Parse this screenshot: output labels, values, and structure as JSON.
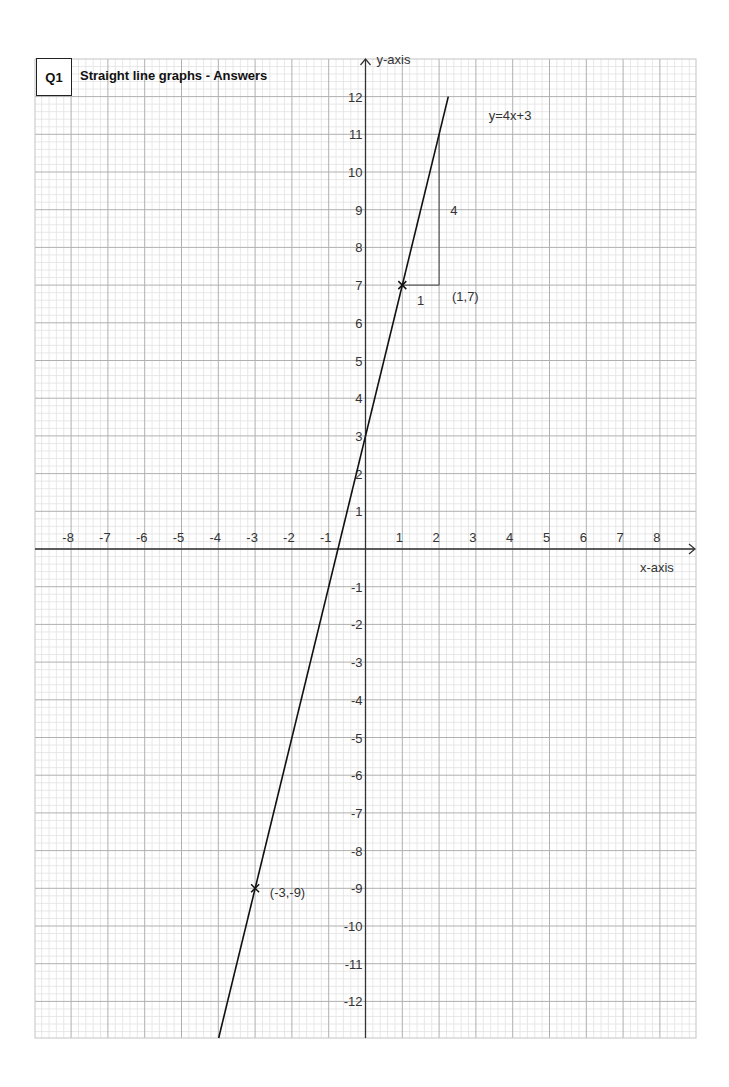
{
  "header": {
    "question_number": "Q1",
    "title": "Straight line graphs - Answers"
  },
  "chart_data": {
    "type": "line",
    "title": "Straight line graphs - Answers",
    "xlabel": "x-axis",
    "ylabel": "y-axis",
    "xlim": [
      -8,
      8
    ],
    "ylim": [
      -12,
      12
    ],
    "grid": true,
    "x_tick_labels": [
      "-8",
      "-7",
      "-6",
      "-5",
      "-4",
      "-3",
      "-2",
      "-1",
      "1",
      "2",
      "3",
      "4",
      "5",
      "6",
      "7",
      "8"
    ],
    "y_tick_labels": [
      "12",
      "11",
      "10",
      "9",
      "8",
      "7",
      "6",
      "5",
      "4",
      "3",
      "2",
      "1",
      "-1",
      "-2",
      "-3",
      "-4",
      "-5",
      "-6",
      "-7",
      "-8",
      "-9",
      "-10",
      "-11",
      "-12"
    ],
    "series": [
      {
        "name": "y=4x+3",
        "equation": "y=4x+3",
        "slope": 4,
        "intercept": 3,
        "x": [
          -3.99,
          2.25
        ],
        "y": [
          -12.97,
          12
        ]
      }
    ],
    "points": [
      {
        "x": 1,
        "y": 7,
        "label": "(1,7)",
        "marker": "x"
      },
      {
        "x": -3,
        "y": -9,
        "label": "(-3,-9)",
        "marker": "x"
      }
    ],
    "slope_triangle": {
      "from": [
        1,
        7
      ],
      "corner": [
        2,
        7
      ],
      "to": [
        2,
        11
      ],
      "run_label": "1",
      "rise_label": "4"
    },
    "annotations": [
      {
        "text": "y=4x+3",
        "x": 3.35,
        "y": 11.5
      },
      {
        "text": "(1,7)",
        "x": 2.35,
        "y": 6.7
      },
      {
        "text": "(-3,-9)",
        "x": -2.6,
        "y": -9.1
      },
      {
        "text": "1",
        "x": 1.4,
        "y": 6.6
      },
      {
        "text": "4",
        "x": 2.3,
        "y": 9
      }
    ],
    "colors": {
      "line": "#111111",
      "axis": "#333333",
      "major_grid": "#b0b0b0",
      "minor_grid": "#e2e2e2",
      "half_grid": "#cfcfcf",
      "text": "#333333"
    }
  }
}
